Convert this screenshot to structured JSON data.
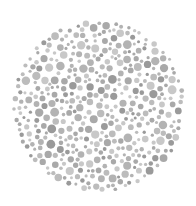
{
  "plate": {
    "type": "color-vision-test-plate",
    "center": [
      99,
      106
    ],
    "radius": 87,
    "background": "#ffffff",
    "dot_colors": [
      "#a9a9a9",
      "#bcbcbc",
      "#c8c8c8",
      "#9a9a9a",
      "#b3b3b3"
    ],
    "dot_radius_range": [
      1.5,
      4.5
    ],
    "seed": 17,
    "visible_numeral": ""
  }
}
